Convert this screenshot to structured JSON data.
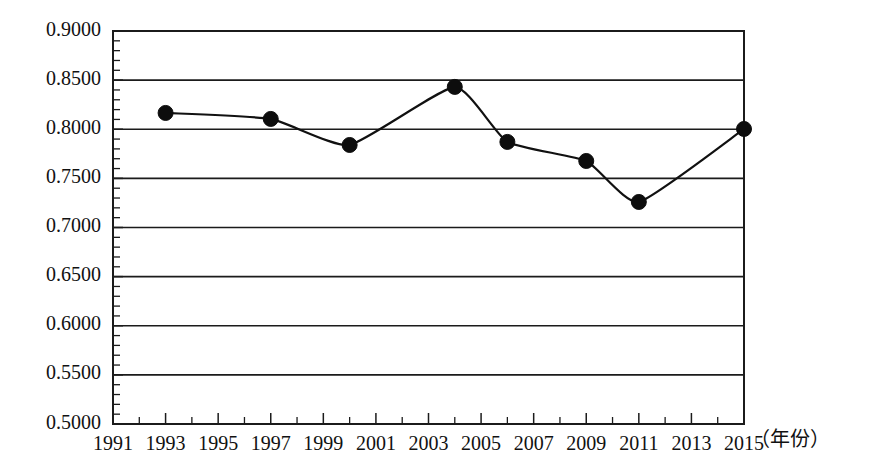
{
  "chart_data": {
    "type": "line",
    "title": "",
    "subtitle": "",
    "xlabel": "（年份）",
    "ylabel": "",
    "xlim": [
      1991,
      2015
    ],
    "ylim": [
      0.5,
      0.9
    ],
    "grid": true,
    "legend": false,
    "legend_position": "none",
    "marker": "filled-circle",
    "line_style": "smooth",
    "x": [
      1993,
      1997,
      2000,
      2004,
      2006,
      2009,
      2011,
      2015
    ],
    "values": [
      0.8166,
      0.8105,
      0.784,
      0.8431,
      0.7871,
      0.7677,
      0.726,
      0.8003
    ],
    "series": [
      {
        "name": "series-1",
        "x": [
          1993,
          1997,
          2000,
          2004,
          2006,
          2009,
          2011,
          2015
        ],
        "values": [
          0.8166,
          0.8105,
          0.784,
          0.8431,
          0.7871,
          0.7677,
          0.726,
          0.8003
        ]
      }
    ],
    "ytick_labels": [
      "0.9000",
      "0.8500",
      "0.8000",
      "0.7500",
      "0.7000",
      "0.6500",
      "0.6000",
      "0.5500",
      "0.5000"
    ],
    "ytick_values": [
      0.9,
      0.85,
      0.8,
      0.75,
      0.7,
      0.65,
      0.6,
      0.55,
      0.5
    ],
    "ytick_minor_step": 0.01,
    "xtick_labels": [
      "1991",
      "1993",
      "1995",
      "1997",
      "1999",
      "2001",
      "2003",
      "2005",
      "2007",
      "2009",
      "2011",
      "2013",
      "2015"
    ],
    "xtick_values": [
      1991,
      1993,
      1995,
      1997,
      1999,
      2001,
      2003,
      2005,
      2007,
      2009,
      2011,
      2013,
      2015
    ],
    "xtick_minor_step": 1,
    "colors": {
      "line": "#111111",
      "marker": "#0d0d0d",
      "grid": "#1b1b1b",
      "frame": "#1b1b1b",
      "text": "#111111",
      "background": "#ffffff"
    }
  }
}
